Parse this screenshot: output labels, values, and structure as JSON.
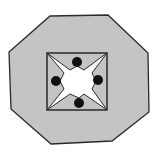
{
  "diagram": {
    "colors": {
      "background": "#ffffff",
      "octagon_fill": "#c4c4c4",
      "outline": "#2a2a2a",
      "star_fill": "#ffffff",
      "square_fill": "#c4c4c4",
      "dot_fill": "#111111"
    },
    "octagon_points": "50,16 108,15 148,53 149,112 112,141 51,144 11,109 9,52",
    "square": {
      "x": 47,
      "y": 53,
      "width": 60,
      "height": 57
    },
    "star_points": "47,53 70,70 77,66 84,70 107,53 92,73 96,81 92,89 107,110 84,94 79,98 70,94 47,110 64,89 60,81 64,73",
    "dots": [
      {
        "name": "dot-top",
        "cx": 77,
        "cy": 62,
        "r": 5
      },
      {
        "name": "dot-left",
        "cx": 56,
        "cy": 81,
        "r": 5
      },
      {
        "name": "dot-right",
        "cx": 98,
        "cy": 80,
        "r": 5
      },
      {
        "name": "dot-bottom",
        "cx": 79,
        "cy": 103,
        "r": 5
      }
    ]
  }
}
